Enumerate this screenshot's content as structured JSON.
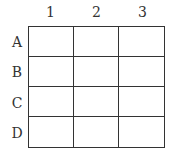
{
  "grid": {
    "columns": [
      "1",
      "2",
      "3"
    ],
    "rows": [
      "A",
      "B",
      "C",
      "D"
    ],
    "cells": [
      [
        "",
        "",
        ""
      ],
      [
        "",
        "",
        ""
      ],
      [
        "",
        "",
        ""
      ],
      [
        "",
        "",
        ""
      ]
    ]
  }
}
